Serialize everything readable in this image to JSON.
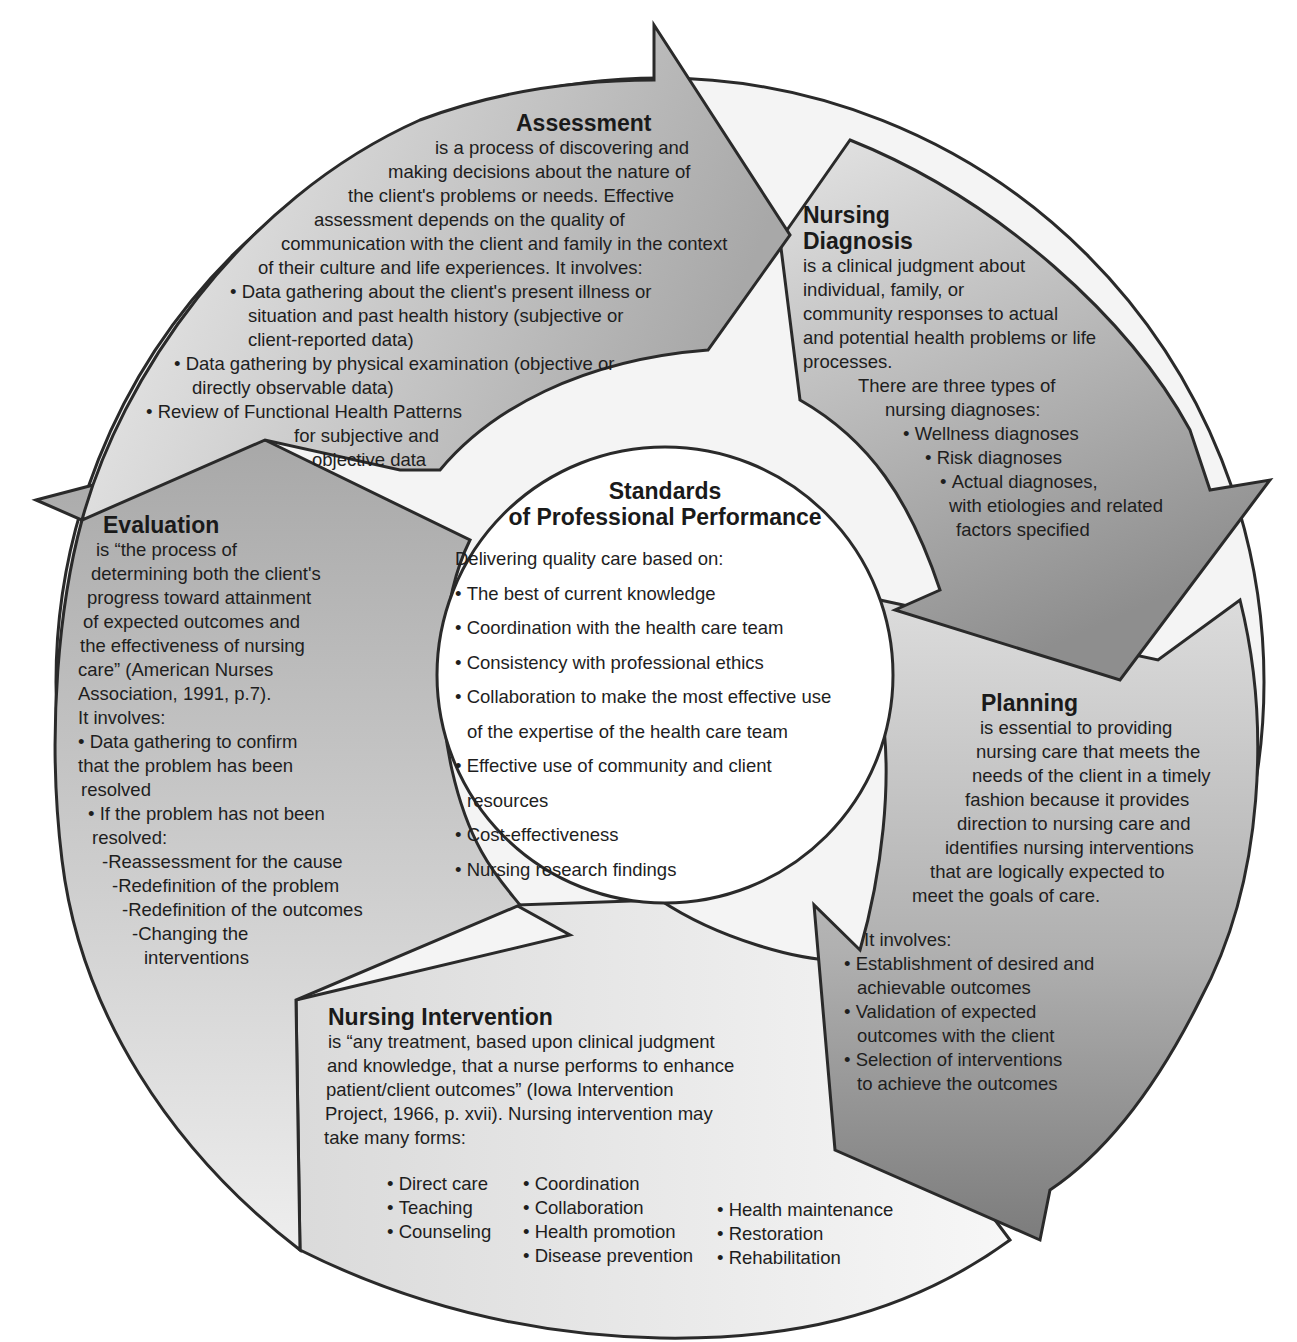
{
  "center": {
    "title_line1": "Standards",
    "title_line2": "of Professional Performance",
    "intro": "Delivering quality care based on:",
    "items": [
      "The best of current knowledge",
      "Coordination with the health care team",
      "Consistency with professional ethics",
      "Collaboration to make the most effective use",
      "of the expertise of the health care team",
      "Effective use of community and client",
      "resources",
      "Cost-effectiveness",
      "Nursing research findings"
    ]
  },
  "assessment": {
    "title": "Assessment",
    "lines": [
      "is a process of discovering and",
      "making decisions about the nature of",
      "the client's problems or needs. Effective",
      "assessment depends on the quality of",
      "communication with the client and family in the context",
      "of their culture and life experiences. It involves:",
      "Data gathering about the client's present illness or",
      "situation and past health history (subjective or",
      "client-reported data)",
      "Data gathering by physical examination (objective or",
      "directly observable data)",
      "Review of Functional Health Patterns",
      "for subjective and",
      "objective data"
    ]
  },
  "diagnosis": {
    "title_line1": "Nursing",
    "title_line2": "Diagnosis",
    "lines": [
      "is a clinical judgment about",
      "individual, family, or",
      "community responses to actual",
      "and potential health problems or life",
      "processes.",
      "There are three types of",
      "nursing diagnoses:",
      "Wellness diagnoses",
      "Risk diagnoses",
      "Actual diagnoses,",
      "with etiologies and related",
      "factors specified"
    ]
  },
  "planning": {
    "title": "Planning",
    "lines": [
      "is essential to providing",
      "nursing care that meets the",
      "needs of the client in a timely",
      "fashion because it provides",
      "direction to nursing care and",
      "identifies nursing interventions",
      "that are logically expected to",
      "meet the goals of care.",
      "It involves:",
      "Establishment of desired and",
      "achievable outcomes",
      "Validation of expected",
      "outcomes with the client",
      "Selection of interventions",
      "to achieve the outcomes"
    ]
  },
  "intervention": {
    "title": "Nursing Intervention",
    "lines": [
      "is “any treatment, based upon clinical judgment",
      "and knowledge, that a nurse performs to enhance",
      "patient/client outcomes” (Iowa Intervention",
      "Project, 1966, p. xvii). Nursing intervention may",
      "take many forms:"
    ],
    "forms_col1": [
      "Direct care",
      "Teaching",
      "Counseling"
    ],
    "forms_col2": [
      "Coordination",
      "Collaboration",
      "Health promotion",
      "Disease prevention"
    ],
    "forms_col3": [
      "Health maintenance",
      "Restoration",
      "Rehabilitation"
    ]
  },
  "evaluation": {
    "title": "Evaluation",
    "lines": [
      "is “the process of",
      "determining both the client's",
      "progress toward attainment",
      "of expected outcomes and",
      "the effectiveness of nursing",
      "care” (American Nurses",
      "Association, 1991, p.7).",
      "It involves:",
      "Data gathering to confirm",
      "that the problem has been",
      "resolved",
      "If the problem has not been",
      "resolved:",
      "-Reassessment for the cause",
      "-Redefinition of the problem",
      "-Redefinition of the outcomes",
      "-Changing the",
      "interventions"
    ]
  },
  "colors": {
    "outline": "#2a2a2a",
    "assessment_fill": "#c4c4c4",
    "diagnosis_fill": "#b4b4b4",
    "planning_fill": "#9e9e9e",
    "intervention_fill": "#ececec",
    "evaluation_fill": "#d2d2d2",
    "center_fill": "#ffffff"
  }
}
